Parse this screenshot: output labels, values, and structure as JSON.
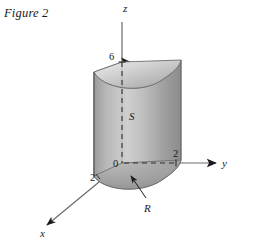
{
  "figure": {
    "caption": "Figure 2",
    "type": "3d-solid-diagram"
  },
  "axes": {
    "z": {
      "label": "z",
      "direction": "up",
      "arrow": true
    },
    "y": {
      "label": "y",
      "direction": "right",
      "arrow": true
    },
    "x": {
      "label": "x",
      "direction": "down-left",
      "arrow": true
    },
    "origin_label": "0"
  },
  "ticks": {
    "z_height": "6",
    "y_radius": "2",
    "x_radius": "2"
  },
  "labels": {
    "solid": "S",
    "region": "R"
  },
  "colors": {
    "background": "#ffffff",
    "ink": "#1a1a1a",
    "axis": "#555555",
    "surface_light": "#e8e8e8",
    "surface_mid": "#b5b5b5",
    "surface_dark": "#8f8f8f",
    "top_light": "#dcdcdc",
    "top_dark": "#a8a8a8",
    "base_shade": "#9a9a9a"
  }
}
